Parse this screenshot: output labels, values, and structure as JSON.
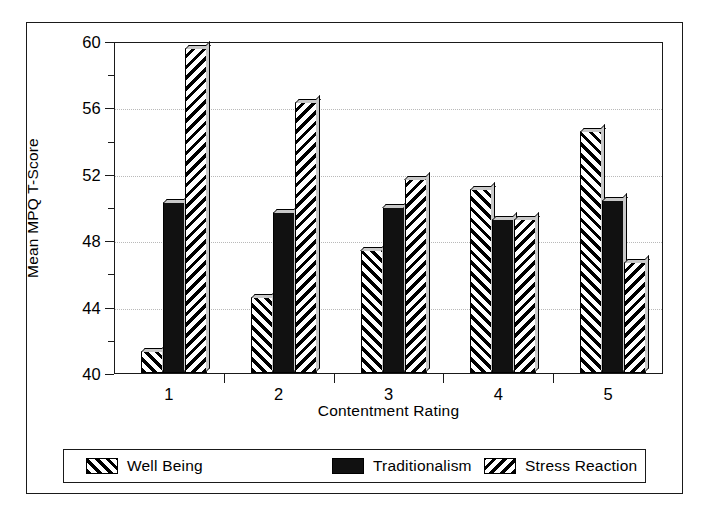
{
  "chart_data": {
    "type": "bar",
    "title": "",
    "xlabel": "Contentment Rating",
    "ylabel": "Mean MPQ T-Score",
    "categories": [
      "1",
      "2",
      "3",
      "4",
      "5"
    ],
    "series": [
      {
        "name": "Well Being",
        "fill": "forward-diagonal-hatch",
        "values": [
          41.3,
          44.6,
          47.4,
          51.1,
          54.6
        ]
      },
      {
        "name": "Traditionalism",
        "fill": "solid-black",
        "values": [
          50.3,
          49.7,
          50.0,
          49.3,
          50.4
        ]
      },
      {
        "name": "Stress Reaction",
        "fill": "backward-diagonal-hatch",
        "values": [
          59.6,
          56.3,
          51.7,
          49.3,
          46.7
        ]
      }
    ],
    "ylim": [
      40,
      60
    ],
    "ytick_major": [
      40,
      44,
      48,
      52,
      56,
      60
    ],
    "ytick_minor": [
      42,
      46,
      50,
      54,
      58
    ],
    "ytick_labels": [
      "40",
      "44",
      "48",
      "52",
      "56",
      "60"
    ],
    "grid": true,
    "grid_axis": "y",
    "legend_position": "bottom-outside"
  },
  "axes": {
    "y_title": "Mean MPQ T-Score",
    "x_title": "Contentment Rating"
  },
  "legend": {
    "entries": [
      {
        "label": "Well Being"
      },
      {
        "label": "Traditionalism"
      },
      {
        "label": "Stress Reaction"
      }
    ]
  },
  "colors": {
    "ink": "#1a1a1a",
    "background": "#ffffff",
    "grid": "#b9b9b9",
    "bar_highlight": "#c9c9c9"
  }
}
